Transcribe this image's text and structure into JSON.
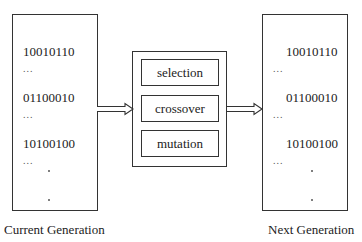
{
  "current_generation": {
    "label": "Current Generation",
    "chromosomes": [
      "10010110",
      "01100010",
      "10100100"
    ],
    "ellipsis": "..."
  },
  "operators": {
    "items": [
      "selection",
      "crossover",
      "mutation"
    ]
  },
  "next_generation": {
    "label": "Next Generation",
    "chromosomes": [
      "10010110",
      "01100010",
      "10100100"
    ],
    "ellipsis": "..."
  }
}
